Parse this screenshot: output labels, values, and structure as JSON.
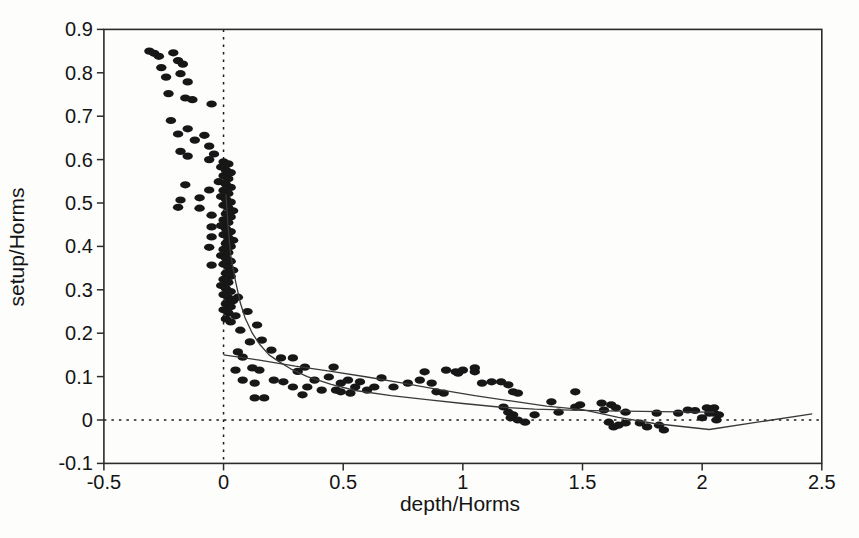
{
  "figure": {
    "background": "#fdfdfc",
    "ink_color": "#141414",
    "axis_color": "#2b2b2b",
    "point_color": "#171717",
    "fit_line_color": "#3a3a3a",
    "reference_line_color": "#1c1c1c"
  },
  "chart_data": {
    "type": "scatter",
    "title": "",
    "xlabel": "depth/Horms",
    "ylabel": "setup/Horms",
    "xlim": [
      -0.5,
      2.5
    ],
    "ylim": [
      -0.1,
      0.9
    ],
    "grid": false,
    "legend": "none",
    "xticks": [
      {
        "v": -0.5,
        "label": "-0.5"
      },
      {
        "v": 0,
        "label": "0"
      },
      {
        "v": 0.5,
        "label": "0.5"
      },
      {
        "v": 1,
        "label": "1"
      },
      {
        "v": 1.5,
        "label": "1.5"
      },
      {
        "v": 2,
        "label": "2"
      },
      {
        "v": 2.5,
        "label": "2.5"
      }
    ],
    "yticks": [
      {
        "v": -0.1,
        "label": "-0.1"
      },
      {
        "v": 0,
        "label": "0"
      },
      {
        "v": 0.1,
        "label": "0.1"
      },
      {
        "v": 0.2,
        "label": "0.2"
      },
      {
        "v": 0.3,
        "label": "0.3"
      },
      {
        "v": 0.4,
        "label": "0.4"
      },
      {
        "v": 0.5,
        "label": "0.5"
      },
      {
        "v": 0.6,
        "label": "0.6"
      },
      {
        "v": 0.7,
        "label": "0.7"
      },
      {
        "v": 0.8,
        "label": "0.8"
      },
      {
        "v": 0.9,
        "label": "0.9"
      }
    ],
    "reference_lines": [
      {
        "axis": "x",
        "v": 0,
        "style": "dotted"
      },
      {
        "axis": "y",
        "v": 0,
        "style": "dotted"
      }
    ],
    "series": [
      {
        "name": "setup-observations",
        "type": "scatter",
        "marker": "ellipse",
        "points": [
          [
            -0.31,
            0.85
          ],
          [
            -0.29,
            0.845
          ],
          [
            -0.27,
            0.838
          ],
          [
            -0.21,
            0.846
          ],
          [
            -0.19,
            0.828
          ],
          [
            -0.17,
            0.82
          ],
          [
            -0.26,
            0.812
          ],
          [
            -0.18,
            0.798
          ],
          [
            -0.24,
            0.79
          ],
          [
            -0.15,
            0.779
          ],
          [
            -0.23,
            0.752
          ],
          [
            -0.16,
            0.742
          ],
          [
            -0.13,
            0.738
          ],
          [
            -0.05,
            0.728
          ],
          [
            -0.22,
            0.69
          ],
          [
            -0.15,
            0.671
          ],
          [
            -0.19,
            0.659
          ],
          [
            -0.08,
            0.656
          ],
          [
            -0.12,
            0.645
          ],
          [
            -0.06,
            0.631
          ],
          [
            -0.18,
            0.619
          ],
          [
            -0.15,
            0.608
          ],
          [
            -0.04,
            0.613
          ],
          [
            -0.06,
            0.6
          ],
          [
            -0.16,
            0.542
          ],
          [
            -0.06,
            0.53
          ],
          [
            -0.18,
            0.507
          ],
          [
            -0.1,
            0.512
          ],
          [
            -0.19,
            0.49
          ],
          [
            -0.1,
            0.488
          ],
          [
            -0.05,
            0.472
          ],
          [
            0.0,
            0.595
          ],
          [
            0.02,
            0.59
          ],
          [
            -0.01,
            0.583
          ],
          [
            0.01,
            0.576
          ],
          [
            0.03,
            0.57
          ],
          [
            0.0,
            0.563
          ],
          [
            0.02,
            0.556
          ],
          [
            -0.02,
            0.549
          ],
          [
            0.01,
            0.543
          ],
          [
            0.03,
            0.536
          ],
          [
            0.0,
            0.529
          ],
          [
            0.02,
            0.522
          ],
          [
            -0.01,
            0.515
          ],
          [
            0.01,
            0.509
          ],
          [
            0.03,
            0.502
          ],
          [
            0.0,
            0.495
          ],
          [
            0.02,
            0.489
          ],
          [
            0.04,
            0.482
          ],
          [
            0.01,
            0.475
          ],
          [
            0.03,
            0.468
          ],
          [
            0.0,
            0.461
          ],
          [
            0.02,
            0.455
          ],
          [
            -0.01,
            0.448
          ],
          [
            0.01,
            0.441
          ],
          [
            0.03,
            0.434
          ],
          [
            0.0,
            0.427
          ],
          [
            -0.05,
            0.445
          ],
          [
            -0.05,
            0.422
          ],
          [
            0.02,
            0.42
          ],
          [
            0.04,
            0.414
          ],
          [
            0.01,
            0.407
          ],
          [
            -0.06,
            0.398
          ],
          [
            0.03,
            0.4
          ],
          [
            0.0,
            0.393
          ],
          [
            0.02,
            0.386
          ],
          [
            -0.01,
            0.379
          ],
          [
            0.01,
            0.373
          ],
          [
            0.03,
            0.366
          ],
          [
            -0.05,
            0.357
          ],
          [
            0.0,
            0.359
          ],
          [
            0.02,
            0.352
          ],
          [
            0.04,
            0.345
          ],
          [
            0.01,
            0.338
          ],
          [
            0.03,
            0.331
          ],
          [
            0.0,
            0.324
          ],
          [
            0.02,
            0.317
          ],
          [
            -0.01,
            0.31
          ],
          [
            0.01,
            0.303
          ],
          [
            0.03,
            0.296
          ],
          [
            0.0,
            0.289
          ],
          [
            0.02,
            0.282
          ],
          [
            0.04,
            0.275
          ],
          [
            0.01,
            0.268
          ],
          [
            0.03,
            0.261
          ],
          [
            0.0,
            0.254
          ],
          [
            0.02,
            0.247
          ],
          [
            0.05,
            0.24
          ],
          [
            0.01,
            0.233
          ],
          [
            0.03,
            0.226
          ],
          [
            0.06,
            0.283
          ],
          [
            0.1,
            0.25
          ],
          [
            0.14,
            0.219
          ],
          [
            0.07,
            0.207
          ],
          [
            0.16,
            0.184
          ],
          [
            0.11,
            0.18
          ],
          [
            0.06,
            0.157
          ],
          [
            0.08,
            0.145
          ],
          [
            0.2,
            0.161
          ],
          [
            0.24,
            0.143
          ],
          [
            0.29,
            0.143
          ],
          [
            0.12,
            0.12
          ],
          [
            0.05,
            0.115
          ],
          [
            0.15,
            0.115
          ],
          [
            0.34,
            0.122
          ],
          [
            0.31,
            0.112
          ],
          [
            0.08,
            0.092
          ],
          [
            0.13,
            0.085
          ],
          [
            0.13,
            0.051
          ],
          [
            0.17,
            0.051
          ],
          [
            0.21,
            0.092
          ],
          [
            0.25,
            0.088
          ],
          [
            0.29,
            0.076
          ],
          [
            0.35,
            0.076
          ],
          [
            0.41,
            0.069
          ],
          [
            0.47,
            0.069
          ],
          [
            0.33,
            0.058
          ],
          [
            0.38,
            0.092
          ],
          [
            0.44,
            0.099
          ],
          [
            0.46,
            0.122
          ],
          [
            0.49,
            0.085
          ],
          [
            0.52,
            0.092
          ],
          [
            0.55,
            0.076
          ],
          [
            0.57,
            0.088
          ],
          [
            0.49,
            0.065
          ],
          [
            0.53,
            0.062
          ],
          [
            0.6,
            0.069
          ],
          [
            0.63,
            0.076
          ],
          [
            0.66,
            0.097
          ],
          [
            0.71,
            0.076
          ],
          [
            0.77,
            0.085
          ],
          [
            0.82,
            0.092
          ],
          [
            0.84,
            0.111
          ],
          [
            0.87,
            0.085
          ],
          [
            0.89,
            0.065
          ],
          [
            0.92,
            0.062
          ],
          [
            0.93,
            0.115
          ],
          [
            0.97,
            0.111
          ],
          [
            1.0,
            0.115
          ],
          [
            1.05,
            0.111
          ],
          [
            0.98,
            0.108
          ],
          [
            1.05,
            0.12
          ],
          [
            1.08,
            0.085
          ],
          [
            1.12,
            0.088
          ],
          [
            1.16,
            0.088
          ],
          [
            1.19,
            0.081
          ],
          [
            1.21,
            0.065
          ],
          [
            1.23,
            0.062
          ],
          [
            1.17,
            0.03
          ],
          [
            1.19,
            0.018
          ],
          [
            1.21,
            0.012
          ],
          [
            1.23,
            0.0
          ],
          [
            1.2,
            0.005
          ],
          [
            1.26,
            -0.005
          ],
          [
            1.3,
            0.012
          ],
          [
            1.37,
            0.042
          ],
          [
            1.4,
            0.018
          ],
          [
            1.47,
            0.03
          ],
          [
            1.49,
            0.035
          ],
          [
            1.47,
            0.065
          ],
          [
            1.58,
            0.039
          ],
          [
            1.62,
            0.035
          ],
          [
            1.59,
            0.023
          ],
          [
            1.64,
            0.028
          ],
          [
            1.68,
            0.018
          ],
          [
            1.61,
            -0.005
          ],
          [
            1.63,
            -0.016
          ],
          [
            1.65,
            -0.012
          ],
          [
            1.68,
            -0.007
          ],
          [
            1.74,
            -0.007
          ],
          [
            1.77,
            -0.016
          ],
          [
            1.82,
            -0.012
          ],
          [
            1.84,
            -0.023
          ],
          [
            1.81,
            0.016
          ],
          [
            1.9,
            0.016
          ],
          [
            1.94,
            0.023
          ],
          [
            1.97,
            0.022
          ],
          [
            2.0,
            0.005
          ],
          [
            2.02,
            0.028
          ],
          [
            2.03,
            0.016
          ],
          [
            2.05,
            0.028
          ],
          [
            2.06,
            0.0
          ],
          [
            2.07,
            0.012
          ],
          [
            2.05,
            0.016
          ]
        ]
      },
      {
        "name": "fit-curve-steep",
        "type": "line",
        "points": [
          [
            0.01,
            0.52
          ],
          [
            0.02,
            0.44
          ],
          [
            0.03,
            0.38
          ],
          [
            0.05,
            0.32
          ],
          [
            0.07,
            0.27
          ],
          [
            0.09,
            0.235
          ],
          [
            0.12,
            0.2
          ],
          [
            0.15,
            0.175
          ],
          [
            0.19,
            0.15
          ],
          [
            0.23,
            0.135
          ],
          [
            0.28,
            0.118
          ],
          [
            0.35,
            0.1
          ],
          [
            0.45,
            0.082
          ],
          [
            0.55,
            0.068
          ],
          [
            0.7,
            0.056
          ],
          [
            0.85,
            0.047
          ],
          [
            1.0,
            0.038
          ],
          [
            1.15,
            0.03
          ],
          [
            1.3,
            0.025
          ],
          [
            1.45,
            0.0225
          ],
          [
            1.6,
            0.021
          ],
          [
            1.75,
            0.02
          ],
          [
            1.9,
            0.019
          ],
          [
            2.05,
            0.018
          ]
        ]
      },
      {
        "name": "fit-line-linear",
        "type": "line",
        "points": [
          [
            0.0,
            0.15
          ],
          [
            0.15,
            0.138
          ],
          [
            0.3,
            0.124
          ],
          [
            0.45,
            0.112
          ],
          [
            0.6,
            0.099
          ],
          [
            0.75,
            0.085
          ],
          [
            0.9,
            0.07
          ],
          [
            1.05,
            0.056
          ],
          [
            1.2,
            0.044
          ],
          [
            1.35,
            0.032
          ],
          [
            1.5,
            0.024
          ],
          [
            1.65,
            0.006
          ],
          [
            1.8,
            -0.008
          ],
          [
            2.03,
            -0.022
          ],
          [
            2.46,
            0.014
          ]
        ]
      }
    ]
  }
}
